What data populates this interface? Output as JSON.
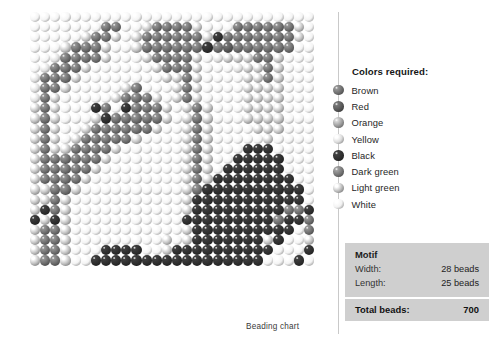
{
  "chart": {
    "caption": "Beading chart"
  },
  "legend": {
    "title": "Colors required:",
    "items": [
      {
        "label": "Brown",
        "color": "#6f6f6f"
      },
      {
        "label": "Red",
        "color": "#595959"
      },
      {
        "label": "Orange",
        "color": "#9e9e9e"
      },
      {
        "label": "Yellow",
        "color": "#dcdcdc"
      },
      {
        "label": "Black",
        "color": "#303030"
      },
      {
        "label": "Dark green",
        "color": "#777777"
      },
      {
        "label": "Light green",
        "color": "#bdbdbd"
      },
      {
        "label": "White",
        "color": "#f2f2f2"
      }
    ]
  },
  "motif": {
    "title": "Motif",
    "width_label": "Width:",
    "width_value": "28 beads",
    "length_label": "Length:",
    "length_value": "25 beads",
    "total_label": "Total beads:",
    "total_value": "700"
  },
  "chart_data": {
    "type": "heatmap",
    "title": "Beading chart",
    "cols": 28,
    "rows": 25,
    "palette_keys": [
      "W",
      "Y",
      "L",
      "O",
      "G",
      "B",
      "R",
      "K"
    ],
    "palette": {
      "W": "#f4f4f4",
      "Y": "#dedede",
      "L": "#c2c2c2",
      "O": "#a3a3a3",
      "G": "#818181",
      "B": "#6d6d6d",
      "R": "#565656",
      "K": "#2e2e2e"
    },
    "palette_names": {
      "W": "White",
      "Y": "Yellow",
      "L": "Light green",
      "O": "Orange",
      "G": "Dark green",
      "B": "Brown",
      "R": "Red",
      "K": "Black"
    },
    "grid": [
      "WWWWWWWWWWWWWWWWWWWWWWWWWWWW",
      "WWWWWWWBBWWLBBBBLWWWBBBBBBLW",
      "WWWWWLBBLWLBBBBBBLKBBBBBBBLW",
      "WWWLBBBLWWLBBBBBBKBRBBBBBBWW",
      "WWYBBBBLWWWLBBBBLWYLLLBBLWWW",
      "WYBBBLWWWWWWLBBBLWWWYLLBLWWW",
      "YBBBLWWWWWWWWLLBLWWWWLLBLWWW",
      "YBBLWWWWWLBWWWLBLWWWWLLLLWWW",
      "YBLWWWWWLBBBLWLBLWWWWLLLLWWW",
      "LBLWWWKBWKBBBLWLBLWWWLLLLWWW",
      "LBLWWWLKBBBBBLWLBLWWWLLLLWWW",
      "LBLWWLBBBBBBLWWLBLWWWWLLLWWW",
      "LBLWLBBBBBLWWWWLBLWWWWWLWWWW",
      "LBLLBBBBLWWWWWWLBLWWWKKKWWWWW",
      "LBBBBBBLWWWWWWWLBLWWKKKKKWWW",
      "LBBBBBLWWWWWWWWLBLWKKKKKKWWW",
      "LBBBBLWWWWWWWWWLBLKKKKKKKKWW",
      "LLBBLWWWWWWWWWWLBKKKKKKKKKKW",
      "LLBLWWWWWWWWWWWLKKKKKKKKKKKW",
      "LKBLWWWWWWWWWWWLKKKKKKKKKBBK",
      "KLKLWWWWWWWWWWWKKKKKKKKKBKKB",
      "LBBLWWWWWWWWWWWLKKKKKKKKKKWB",
      "LBBLWWWWWWWWWLWLKKKKKKKLKWWL",
      "LBBLWWWKKKKWWLKKKKKKKKKKWWWK",
      "LBBLWWKKKKKKKKKKKKKKKKKWWWKW"
    ],
    "grid_note": "Each character is one bead; letters index palette_keys."
  }
}
